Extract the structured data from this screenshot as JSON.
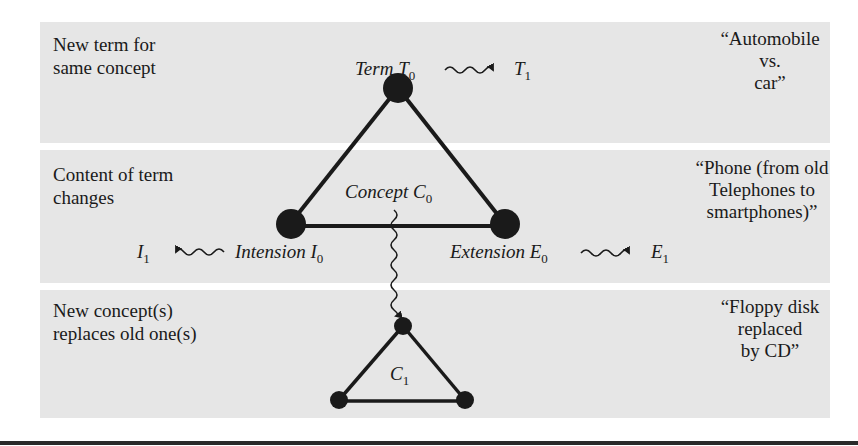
{
  "bands": [
    {
      "left_label": [
        "New term for",
        "same concept"
      ],
      "example": [
        "“Automobile",
        "vs.",
        "car”"
      ]
    },
    {
      "left_label": [
        "Content of term",
        "changes"
      ],
      "example": [
        "“Phone (from old",
        "Telephones to",
        "smartphones)”"
      ]
    },
    {
      "left_label": [
        "New concept(s)",
        "replaces old one(s)"
      ],
      "example": [
        "“Floppy disk",
        "replaced",
        "by CD”"
      ]
    }
  ],
  "triangle": {
    "top": {
      "label": "Term",
      "symbol": "T",
      "sub": "0"
    },
    "left": {
      "label": "Intension",
      "symbol": "I",
      "sub": "0"
    },
    "right": {
      "label": "Extension",
      "symbol": "E",
      "sub": "0"
    },
    "center": {
      "label": "Concept",
      "symbol": "C",
      "sub": "0"
    }
  },
  "drift_targets": {
    "term": {
      "symbol": "T",
      "sub": "1"
    },
    "intension": {
      "symbol": "I",
      "sub": "1"
    },
    "extension": {
      "symbol": "E",
      "sub": "1"
    }
  },
  "new_concept": {
    "symbol": "C",
    "sub": "1"
  },
  "colors": {
    "band": "#e6e6e6",
    "ink": "#1a1a1a"
  }
}
